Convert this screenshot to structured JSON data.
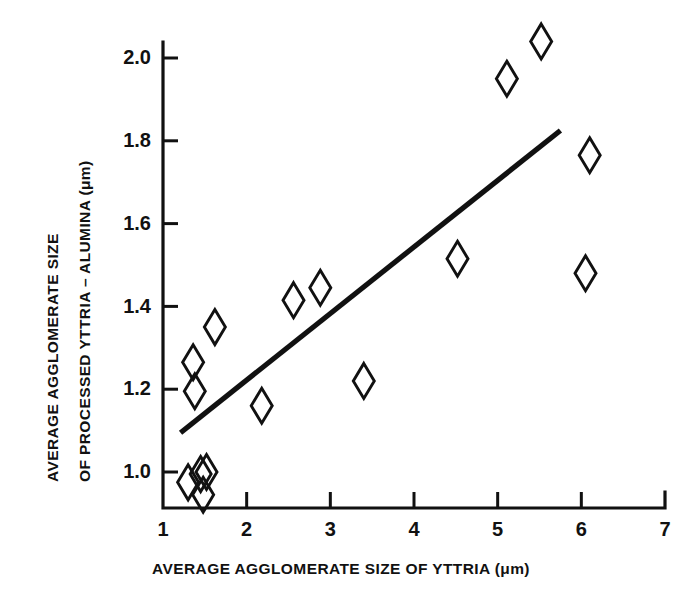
{
  "chart_data": {
    "type": "scatter",
    "title": "",
    "xlabel": "AVERAGE AGGLOMERATE SIZE OF YTTRIA (μm)",
    "ylabel_line1": "AVERAGE AGGLOMERATE SIZE",
    "ylabel_line2": "OF PROCESSED YTTRIA – ALUMINA (μm)",
    "xlim": [
      1,
      7
    ],
    "ylim": [
      0.9,
      2.1
    ],
    "grid": false,
    "legend": "none",
    "xticks": [
      1,
      2,
      3,
      4,
      5,
      6,
      7
    ],
    "xtick_labels": [
      "1",
      "2",
      "3",
      "4",
      "5",
      "6",
      "7"
    ],
    "yticks": [
      1.0,
      1.2,
      1.4,
      1.6,
      1.8,
      2.0
    ],
    "ytick_labels": [
      "1.0",
      "1.2",
      "1.4",
      "1.6",
      "1.8",
      "2.0"
    ],
    "marker": "open-diamond",
    "marker_color": "#111111",
    "line_color": "#111111",
    "points": [
      {
        "x": 1.3,
        "y": 0.975
      },
      {
        "x": 1.45,
        "y": 0.995
      },
      {
        "x": 1.48,
        "y": 0.945
      },
      {
        "x": 1.36,
        "y": 1.265
      },
      {
        "x": 1.38,
        "y": 1.195
      },
      {
        "x": 1.62,
        "y": 1.35
      },
      {
        "x": 2.18,
        "y": 1.16
      },
      {
        "x": 2.56,
        "y": 1.415
      },
      {
        "x": 2.88,
        "y": 1.445
      },
      {
        "x": 3.4,
        "y": 1.22
      },
      {
        "x": 4.52,
        "y": 1.515
      },
      {
        "x": 5.11,
        "y": 1.95
      },
      {
        "x": 5.52,
        "y": 2.04
      },
      {
        "x": 6.05,
        "y": 1.48
      },
      {
        "x": 6.1,
        "y": 1.765
      },
      {
        "x": 1.52,
        "y": 1.0
      }
    ],
    "trend_line": {
      "type": "linear-fit",
      "x_start": 1.21,
      "y_start": 1.095,
      "x_end": 5.75,
      "y_end": 1.825
    }
  }
}
